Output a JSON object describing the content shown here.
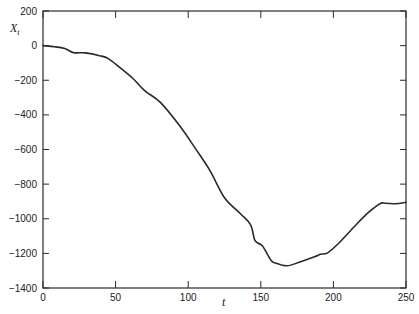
{
  "chart_data": {
    "type": "line",
    "title": "",
    "xlabel": "t",
    "ylabel": "X_t",
    "ylabel_main": "X",
    "ylabel_sub": "t",
    "xlim": [
      0,
      250
    ],
    "ylim": [
      -1400,
      200
    ],
    "xticks": [
      0,
      50,
      100,
      150,
      200,
      250
    ],
    "yticks": [
      200,
      0,
      -200,
      -400,
      -600,
      -800,
      -1000,
      -1200,
      -1400
    ],
    "grid": false,
    "legend": null,
    "line_color": "#2a2a2a",
    "series": [
      {
        "name": "X_t",
        "x": [
          0,
          8,
          15,
          21,
          29,
          39,
          45,
          53,
          62,
          70,
          81,
          94,
          105,
          115,
          125,
          136,
          143,
          146,
          151,
          157,
          160,
          168,
          177,
          187,
          191,
          196,
          204,
          215,
          224,
          232,
          236,
          243,
          250
        ],
        "y": [
          0,
          -6,
          -17,
          -40,
          -42,
          -58,
          -75,
          -127,
          -190,
          -260,
          -329,
          -462,
          -595,
          -722,
          -879,
          -971,
          -1035,
          -1127,
          -1156,
          -1240,
          -1255,
          -1272,
          -1249,
          -1220,
          -1205,
          -1197,
          -1139,
          -1040,
          -965,
          -913,
          -910,
          -913,
          -905
        ]
      }
    ]
  }
}
